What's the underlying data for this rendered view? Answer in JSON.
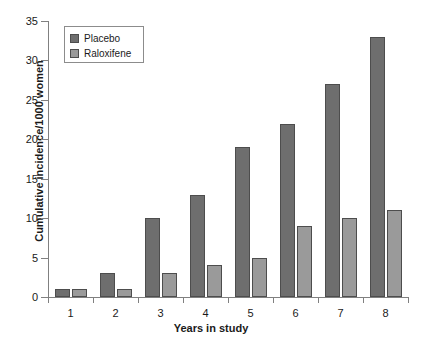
{
  "chart_data": {
    "type": "bar",
    "title": "",
    "subtitle": "",
    "xlabel": "Years in study",
    "ylabel": "Cumulative incidence/1000 women",
    "categories": [
      "1",
      "2",
      "3",
      "4",
      "5",
      "6",
      "7",
      "8"
    ],
    "series": [
      {
        "name": "Placebo",
        "color": "#6e6e6e",
        "values": [
          1,
          3,
          10,
          13,
          19,
          22,
          27,
          33
        ]
      },
      {
        "name": "Raloxifene",
        "color": "#9a9a9a",
        "values": [
          1,
          1,
          3,
          4,
          5,
          9,
          10,
          11
        ]
      }
    ],
    "ylim": [
      0,
      35
    ],
    "yticks": [
      0,
      5,
      10,
      15,
      20,
      25,
      30,
      35
    ],
    "ytick_labels": [
      "0",
      "5",
      "10",
      "15",
      "20",
      "25",
      "30",
      "35"
    ],
    "grid": false,
    "legend_position": "top-left",
    "legend_entries": [
      "Placebo",
      "Raloxifene"
    ]
  },
  "axes": {
    "y_title": "Cumulative incidence/1000 women",
    "x_title": "Years in study"
  },
  "legend": {
    "items": [
      {
        "label": "Placebo"
      },
      {
        "label": "Raloxifene"
      }
    ]
  }
}
